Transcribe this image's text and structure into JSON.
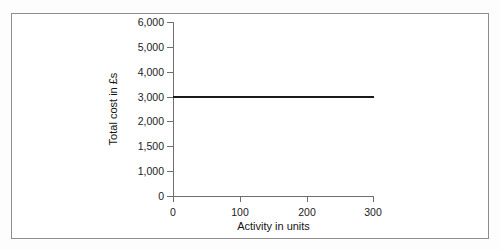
{
  "chart_data": {
    "type": "line",
    "title": "",
    "subtitle": "",
    "xlabel": "Activity in units",
    "ylabel": "Total cost in £s",
    "grid": false,
    "legend": false,
    "legend_position": "none",
    "xlim": [
      0,
      300
    ],
    "ylim": [
      0,
      6000
    ],
    "x_ticks": [
      0,
      100,
      200,
      300
    ],
    "x_tick_labels": [
      "0",
      "100",
      "200",
      "300"
    ],
    "y_ticks": [
      0,
      1000,
      1500,
      2000,
      3000,
      4000,
      5000,
      6000
    ],
    "y_tick_labels": [
      "0",
      "1,000",
      "1,500",
      "2,000",
      "3,000",
      "4,000",
      "5,000",
      "6,000"
    ],
    "y_axis_note": "tick marks are evenly spaced although the labelled values are not evenly incremented",
    "series": [
      {
        "name": "Total cost",
        "color": "#1a1a1a",
        "x": [
          0,
          300
        ],
        "values": [
          3000,
          3000
        ]
      }
    ],
    "annotations": []
  },
  "axes": {
    "y_title": "Total cost in £s",
    "x_title": "Activity in units",
    "y_tick_labels": [
      "6,000",
      "5,000",
      "4,000",
      "3,000",
      "2,000",
      "1,500",
      "1,000",
      "0"
    ],
    "x_tick_labels": [
      "0",
      "100",
      "200",
      "300"
    ]
  },
  "colors": {
    "series_line": "#1a1a1a",
    "axis": "#6e6e6e",
    "frame_border": "#8d8d8d",
    "background": "#ffffff",
    "text": "#141414"
  }
}
